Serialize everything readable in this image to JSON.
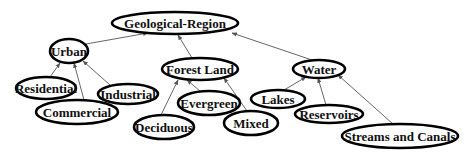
{
  "diagram": {
    "type": "tree",
    "title": "Geological-Region",
    "colors": {
      "node_stroke": "#000000",
      "edge": "#555555",
      "text": "#111111",
      "background": "#ffffff"
    },
    "nodes": [
      {
        "id": "root",
        "label": "Geological-Region",
        "cx": 175,
        "cy": 23,
        "rx": 63,
        "ry": 11
      },
      {
        "id": "urban",
        "label": "Urban",
        "cx": 69,
        "cy": 51,
        "rx": 19,
        "ry": 12
      },
      {
        "id": "forest",
        "label": "Forest Land",
        "cx": 200,
        "cy": 69,
        "rx": 38,
        "ry": 11
      },
      {
        "id": "water",
        "label": "Water",
        "cx": 319,
        "cy": 69,
        "rx": 26,
        "ry": 9
      },
      {
        "id": "residential",
        "label": "Residential",
        "cx": 46,
        "cy": 88,
        "rx": 30,
        "ry": 11
      },
      {
        "id": "commercial",
        "label": "Commercial",
        "cx": 77,
        "cy": 112,
        "rx": 41,
        "ry": 12
      },
      {
        "id": "industrial",
        "label": "Industrial",
        "cx": 128,
        "cy": 94,
        "rx": 30,
        "ry": 10
      },
      {
        "id": "evergreen",
        "label": "Evergreen",
        "cx": 209,
        "cy": 103,
        "rx": 31,
        "ry": 12
      },
      {
        "id": "deciduous",
        "label": "Deciduous",
        "cx": 164,
        "cy": 127,
        "rx": 30,
        "ry": 12
      },
      {
        "id": "mixed",
        "label": "Mixed",
        "cx": 251,
        "cy": 123,
        "rx": 27,
        "ry": 12
      },
      {
        "id": "lakes",
        "label": "Lakes",
        "cx": 278,
        "cy": 99,
        "rx": 27,
        "ry": 9
      },
      {
        "id": "reservoirs",
        "label": "Reservoirs",
        "cx": 329,
        "cy": 114,
        "rx": 34,
        "ry": 9
      },
      {
        "id": "streams",
        "label": "Streams and Canals",
        "cx": 400,
        "cy": 136,
        "rx": 58,
        "ry": 12
      }
    ],
    "edges": [
      {
        "from": "urban",
        "to": "root",
        "x1": 86,
        "y1": 44,
        "x2": 148,
        "y2": 33
      },
      {
        "from": "forest",
        "to": "root",
        "x1": 192,
        "y1": 58,
        "x2": 178,
        "y2": 35
      },
      {
        "from": "water",
        "to": "root",
        "x1": 312,
        "y1": 60,
        "x2": 232,
        "y2": 33
      },
      {
        "from": "residential",
        "to": "urban",
        "x1": 50,
        "y1": 77,
        "x2": 60,
        "y2": 63
      },
      {
        "from": "commercial",
        "to": "urban",
        "x1": 84,
        "y1": 100,
        "x2": 74,
        "y2": 63
      },
      {
        "from": "industrial",
        "to": "urban",
        "x1": 110,
        "y1": 85,
        "x2": 83,
        "y2": 61
      },
      {
        "from": "deciduous",
        "to": "forest",
        "x1": 161,
        "y1": 115,
        "x2": 178,
        "y2": 80
      },
      {
        "from": "evergreen",
        "to": "forest",
        "x1": 200,
        "y1": 91,
        "x2": 187,
        "y2": 80
      },
      {
        "from": "mixed",
        "to": "forest",
        "x1": 247,
        "y1": 111,
        "x2": 224,
        "y2": 78
      },
      {
        "from": "lakes",
        "to": "water",
        "x1": 284,
        "y1": 90,
        "x2": 306,
        "y2": 77
      },
      {
        "from": "reservoirs",
        "to": "water",
        "x1": 326,
        "y1": 105,
        "x2": 318,
        "y2": 78
      },
      {
        "from": "streams",
        "to": "water",
        "x1": 393,
        "y1": 124,
        "x2": 338,
        "y2": 75
      }
    ]
  }
}
